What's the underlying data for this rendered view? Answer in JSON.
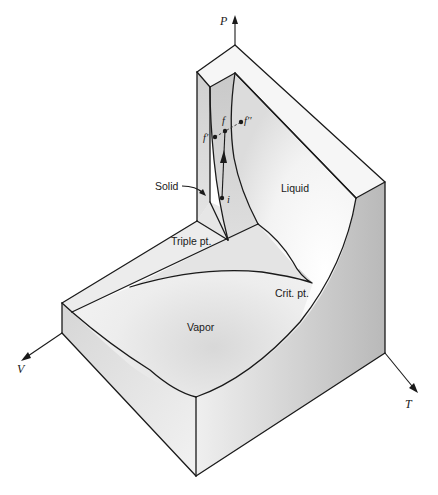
{
  "figure": {
    "axes": {
      "p_label": "P",
      "v_label": "V",
      "t_label": "T"
    },
    "regions": {
      "solid": "Solid",
      "liquid": "Liquid",
      "vapor": "Vapor",
      "triple_point": "Triple pt.",
      "critical_point": "Crit. pt."
    },
    "points": {
      "f": "f",
      "f_prime": "f′",
      "f_double_prime": "f′′",
      "i": "i"
    },
    "colors": {
      "line": "#1a1a1a",
      "surface_light": "#f4f4f4",
      "surface_mid": "#dcdcdc",
      "surface_dark": "#b8b8b8",
      "background": "#ffffff"
    }
  }
}
